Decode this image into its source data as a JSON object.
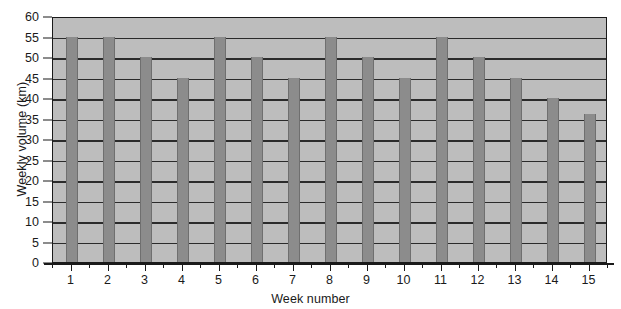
{
  "chart_data": {
    "type": "bar",
    "title": "",
    "subtitle": "",
    "xlabel": "Week number",
    "ylabel": "Weekly volume (km)",
    "categories": [
      "1",
      "2",
      "3",
      "4",
      "5",
      "6",
      "7",
      "8",
      "9",
      "10",
      "11",
      "12",
      "13",
      "14",
      "15"
    ],
    "values": [
      55,
      55,
      50,
      45,
      55,
      50,
      45,
      55,
      50,
      45,
      55,
      50,
      45,
      40,
      36
    ],
    "series": [
      {
        "name": "Weekly volume",
        "values": [
          55,
          55,
          50,
          45,
          55,
          50,
          45,
          55,
          50,
          45,
          55,
          50,
          45,
          40,
          36
        ]
      }
    ],
    "ylim": [
      0,
      60
    ],
    "ytick_values": [
      0,
      5,
      10,
      15,
      20,
      25,
      30,
      35,
      40,
      45,
      50,
      55,
      60
    ],
    "ytick_labels": [
      "0",
      "5",
      "10",
      "15",
      "20",
      "25",
      "30",
      "35",
      "40",
      "45",
      "50",
      "55",
      "60"
    ],
    "xtick_labels": [
      "1",
      "2",
      "3",
      "4",
      "5",
      "6",
      "7",
      "8",
      "9",
      "10",
      "11",
      "12",
      "13",
      "14",
      "15"
    ],
    "grid": "horizontal",
    "legend": "none",
    "annotations": [],
    "colors": {
      "bar_fill": "#8c8c8c",
      "plot_background": "#bdbdbd",
      "gridline": "#2b2b2b",
      "axis": "#1a1a1a",
      "page_background": "#ffffff",
      "text": "#1a1a1a"
    }
  }
}
